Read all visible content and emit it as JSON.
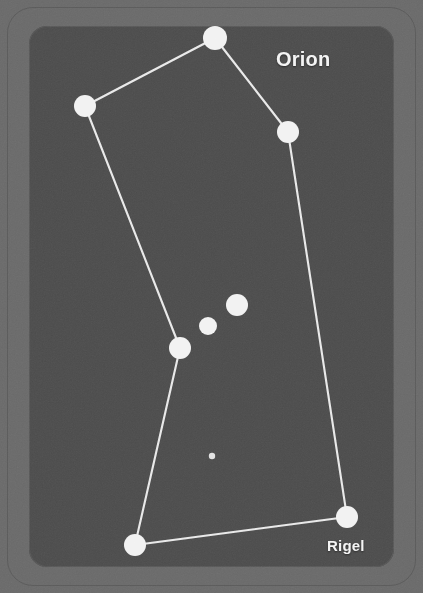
{
  "card": {
    "frame_color": "#6a6a6a",
    "panel_color": "#4b4b4b",
    "outline_color": "#5b5b5b"
  },
  "labels": {
    "constellation": "Orion",
    "rigel": "Rigel"
  },
  "chart_data": {
    "type": "scatter",
    "title": "Orion",
    "xlabel": "",
    "ylabel": "",
    "xlim": [
      0,
      423
    ],
    "ylim": [
      0,
      593
    ],
    "grid": false,
    "legend": "none",
    "star_color": "#f2f2f2",
    "line_color": "#e9e9e9",
    "annotations": [
      {
        "text": "Orion",
        "x": 276,
        "y": 58
      },
      {
        "text": "Rigel",
        "x": 327,
        "y": 545
      }
    ],
    "points": [
      {
        "name": "betelgeuse",
        "x": 215,
        "y": 38,
        "r": 12
      },
      {
        "name": "bellatrix",
        "x": 85,
        "y": 106,
        "r": 11
      },
      {
        "name": "meissa",
        "x": 288,
        "y": 132,
        "r": 11
      },
      {
        "name": "alnitak",
        "x": 237,
        "y": 305,
        "r": 11
      },
      {
        "name": "alnilam",
        "x": 208,
        "y": 326,
        "r": 9
      },
      {
        "name": "mintaka",
        "x": 180,
        "y": 348,
        "r": 11
      },
      {
        "name": "nebula",
        "x": 212,
        "y": 456,
        "r": 3.2
      },
      {
        "name": "saiph",
        "x": 135,
        "y": 545,
        "r": 11
      },
      {
        "name": "rigel",
        "x": 347,
        "y": 517,
        "r": 11
      }
    ],
    "edges": [
      {
        "from": "betelgeuse",
        "to": "bellatrix"
      },
      {
        "from": "betelgeuse",
        "to": "meissa"
      },
      {
        "from": "bellatrix",
        "to": "mintaka"
      },
      {
        "from": "meissa",
        "to": "rigel"
      },
      {
        "from": "mintaka",
        "to": "saiph"
      },
      {
        "from": "saiph",
        "to": "rigel"
      }
    ]
  }
}
